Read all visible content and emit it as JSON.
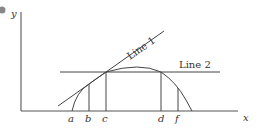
{
  "diagram": {
    "axes": {
      "x_label": "x",
      "y_label": "y"
    },
    "lines": [
      {
        "id": "line1",
        "label": "Line 1",
        "kind": "tangent line"
      },
      {
        "id": "line2",
        "label": "Line 2",
        "kind": "horizontal line"
      }
    ],
    "curve": {
      "kind": "concave curve (arc)"
    },
    "points": [
      {
        "id": "a",
        "label": "a"
      },
      {
        "id": "b",
        "label": "b"
      },
      {
        "id": "c",
        "label": "c"
      },
      {
        "id": "d",
        "label": "d"
      },
      {
        "id": "f",
        "label": "f"
      }
    ],
    "colors": {
      "stroke": "#444444",
      "text": "#333333",
      "bullet": "#888888"
    }
  }
}
